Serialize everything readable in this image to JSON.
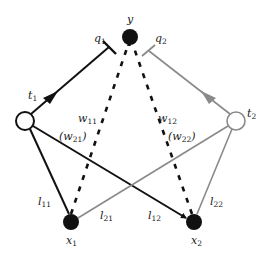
{
  "diagram": {
    "colors": {
      "dark": "#111111",
      "gray": "#8a8a8a",
      "background": "#ffffff"
    },
    "nodes": {
      "y": {
        "label": "y",
        "x": 130,
        "y": 37,
        "r": 8,
        "style": "filled"
      },
      "t1": {
        "label": "t",
        "sub": "1",
        "x": 25,
        "y": 121,
        "r": 9,
        "style": "open-dark"
      },
      "t2": {
        "label": "t",
        "sub": "2",
        "x": 236,
        "y": 121,
        "r": 9,
        "style": "open-gray"
      },
      "x1": {
        "label": "x",
        "sub": "1",
        "x": 71,
        "y": 222,
        "r": 8,
        "style": "filled"
      },
      "x2": {
        "label": "x",
        "sub": "2",
        "x": 194,
        "y": 222,
        "r": 8,
        "style": "filled"
      }
    },
    "labels": {
      "y": "y",
      "q1": {
        "main": "q",
        "sub": "1"
      },
      "q2": {
        "main": "q",
        "sub": "2"
      },
      "t1": {
        "main": "t",
        "sub": "1"
      },
      "t2": {
        "main": "t",
        "sub": "2"
      },
      "w11": {
        "main": "w",
        "sub": "11"
      },
      "w12": {
        "main": "w",
        "sub": "12"
      },
      "w21": {
        "open": "(",
        "main": "w",
        "sub": "21",
        "close": ")"
      },
      "w22": {
        "open": "(",
        "main": "w",
        "sub": "22",
        "close": ")"
      },
      "l11": {
        "main": "l",
        "sub": "11"
      },
      "l21": {
        "main": "l",
        "sub": "21"
      },
      "l12": {
        "main": "l",
        "sub": "12"
      },
      "l22": {
        "main": "l",
        "sub": "22"
      },
      "x1": {
        "main": "x",
        "sub": "1"
      },
      "x2": {
        "main": "x",
        "sub": "2"
      }
    },
    "edges": [
      {
        "from": "t1",
        "to": "y",
        "label": "q1",
        "type": "inhibitory",
        "color": "dark",
        "arrow_mid": true
      },
      {
        "from": "t2",
        "to": "y",
        "label": "q2",
        "type": "inhibitory",
        "color": "gray",
        "arrow_mid": true
      },
      {
        "from": "x1",
        "to": "y",
        "label": "w11 (w21)",
        "type": "dashed",
        "color": "dark"
      },
      {
        "from": "x2",
        "to": "y",
        "label": "w12 (w22)",
        "type": "dashed",
        "color": "dark"
      },
      {
        "from": "t1",
        "to": "x1",
        "label": "l11",
        "type": "solid",
        "color": "dark"
      },
      {
        "from": "t1",
        "to": "x2",
        "label": "l12",
        "type": "solid-arrow",
        "color": "dark"
      },
      {
        "from": "t2",
        "to": "x1",
        "label": "l21",
        "type": "solid-arrow",
        "color": "gray"
      },
      {
        "from": "t2",
        "to": "x2",
        "label": "l22",
        "type": "solid",
        "color": "gray"
      }
    ]
  }
}
